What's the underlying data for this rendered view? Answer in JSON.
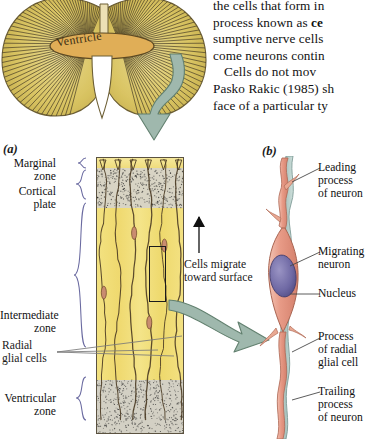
{
  "figure": {
    "panel_a_letter": "(a)",
    "panel_b_letter": "(b)",
    "ventricle_label": "Ventricle"
  },
  "body_text": {
    "line1": "the cells that form in",
    "line2_pre": "process known as ",
    "line2_bold": "ce",
    "line3": "sumptive nerve cells",
    "line4": "come neurons contin",
    "line5": "Cells do not mov",
    "line6": "Pasko Rakic (1985) sh",
    "line7": "face of a particular ty"
  },
  "panel_a": {
    "zones": [
      {
        "id": "marginal",
        "label_line1": "Marginal",
        "label_line2": "zone"
      },
      {
        "id": "cortical",
        "label_line1": "Cortical",
        "label_line2": "plate"
      },
      {
        "id": "intermediate",
        "label_line1": "Intermediate",
        "label_line2": "zone"
      },
      {
        "id": "ventricular",
        "label_line1": "Ventricular",
        "label_line2": "zone"
      }
    ],
    "radial_glial_line1": "Radial",
    "radial_glial_line2": "glial cells",
    "migrate_line1": "Cells migrate",
    "migrate_line2": "toward surface"
  },
  "panel_b": {
    "labels": [
      {
        "id": "leading-process",
        "line1": "Leading",
        "line2": "process",
        "line3": "of neuron"
      },
      {
        "id": "migrating-neuron",
        "line1": "Migrating",
        "line2": "neuron",
        "line3": ""
      },
      {
        "id": "nucleus",
        "line1": "Nucleus",
        "line2": "",
        "line3": ""
      },
      {
        "id": "radial-process",
        "line1": "Process",
        "line2": "of radial",
        "line3": "glial cell"
      },
      {
        "id": "trailing-process",
        "line1": "Trailing",
        "line2": "process",
        "line3": "of neuron"
      }
    ]
  },
  "colors": {
    "arrow_sage": "#9fb8ad",
    "arrow_sage_dark": "#6f8d81",
    "brain_yellow": "#ddc96a",
    "ventricle_tan": "#e3b45e",
    "column_yellow": "#f2e07f",
    "zone_gray": "#d5d2c6",
    "neuron_pink": "#e8a08d",
    "nucleus_purple": "#7a74aa",
    "glia_blue": "#b9cdc9"
  }
}
